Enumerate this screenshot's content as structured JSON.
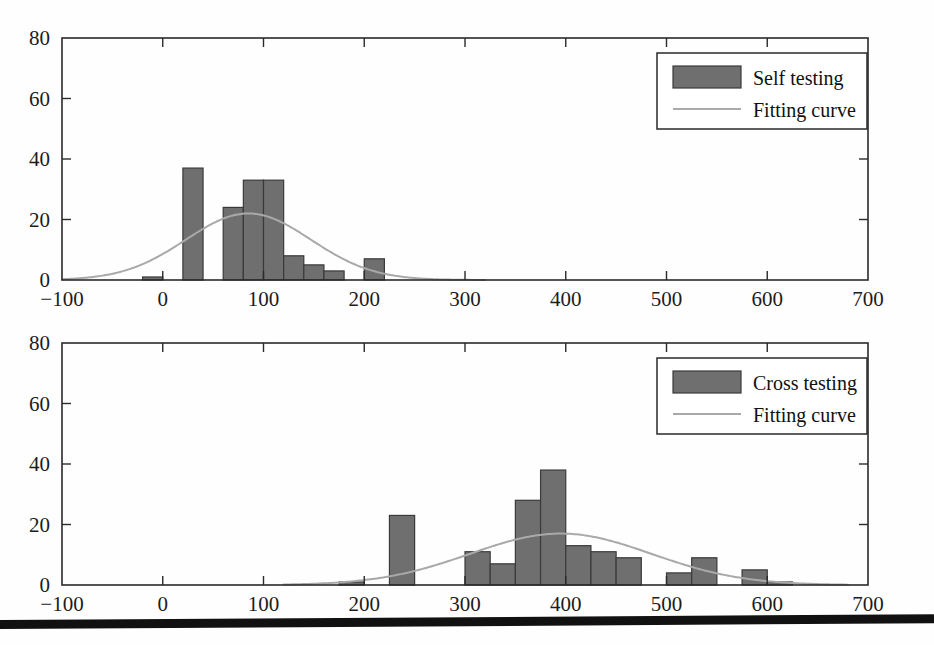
{
  "figure": {
    "background": "#ffffff",
    "bar_color": "#6f6f6f",
    "bar_edge_color": "#3a3a3a",
    "curve_color": "#a9a9a9",
    "axis_color": "#2a2a2a",
    "rule_color": "#111111"
  },
  "chart_data": [
    {
      "type": "bar",
      "id": "self-testing-histogram",
      "title": "",
      "xlabel": "",
      "ylabel": "",
      "xlim": [
        -100,
        700
      ],
      "ylim": [
        0,
        80
      ],
      "xticks": [
        -100,
        0,
        100,
        200,
        300,
        400,
        500,
        600,
        700
      ],
      "xticklabels": [
        "-100",
        "0",
        "100",
        "200",
        "300",
        "400",
        "500",
        "600",
        "700"
      ],
      "yticks": [
        0,
        20,
        40,
        60,
        80
      ],
      "yticklabels": [
        "0",
        "20",
        "40",
        "60",
        "80"
      ],
      "grid": false,
      "legend_position": "upper right",
      "legend": [
        "Self testing",
        "Fitting curve"
      ],
      "bin_width": 20,
      "bins": [
        {
          "x0": -80,
          "x1": -60,
          "value": 0
        },
        {
          "x0": -60,
          "x1": -40,
          "value": 0
        },
        {
          "x0": -40,
          "x1": -20,
          "value": 0
        },
        {
          "x0": -20,
          "x1": 0,
          "value": 1
        },
        {
          "x0": 0,
          "x1": 20,
          "value": 0
        },
        {
          "x0": 20,
          "x1": 40,
          "value": 37
        },
        {
          "x0": 40,
          "x1": 60,
          "value": 0
        },
        {
          "x0": 60,
          "x1": 80,
          "value": 24
        },
        {
          "x0": 80,
          "x1": 100,
          "value": 33
        },
        {
          "x0": 100,
          "x1": 120,
          "value": 33
        },
        {
          "x0": 120,
          "x1": 140,
          "value": 8
        },
        {
          "x0": 140,
          "x1": 160,
          "value": 5
        },
        {
          "x0": 160,
          "x1": 180,
          "value": 3
        },
        {
          "x0": 180,
          "x1": 200,
          "value": 0
        },
        {
          "x0": 200,
          "x1": 220,
          "value": 7
        },
        {
          "x0": 220,
          "x1": 240,
          "value": 0
        }
      ],
      "fit": {
        "label": "Fitting curve",
        "kind": "gaussian",
        "peak_x": 85,
        "peak_y": 22,
        "sigma": 62,
        "x_start": -100,
        "x_end": 320
      }
    },
    {
      "type": "bar",
      "id": "cross-testing-histogram",
      "title": "",
      "xlabel": "",
      "ylabel": "",
      "xlim": [
        -100,
        700
      ],
      "ylim": [
        0,
        80
      ],
      "xticks": [
        -100,
        0,
        100,
        200,
        300,
        400,
        500,
        600,
        700
      ],
      "xticklabels": [
        "-100",
        "0",
        "100",
        "200",
        "300",
        "400",
        "500",
        "600",
        "700"
      ],
      "yticks": [
        0,
        20,
        40,
        60,
        80
      ],
      "yticklabels": [
        "0",
        "20",
        "40",
        "60",
        "80"
      ],
      "grid": false,
      "legend_position": "upper right",
      "legend": [
        "Cross testing",
        "Fitting curve"
      ],
      "bin_width": 25,
      "bins": [
        {
          "x0": 175,
          "x1": 200,
          "value": 1
        },
        {
          "x0": 200,
          "x1": 225,
          "value": 0
        },
        {
          "x0": 225,
          "x1": 250,
          "value": 23
        },
        {
          "x0": 250,
          "x1": 275,
          "value": 0
        },
        {
          "x0": 275,
          "x1": 300,
          "value": 0
        },
        {
          "x0": 300,
          "x1": 325,
          "value": 11
        },
        {
          "x0": 325,
          "x1": 350,
          "value": 7
        },
        {
          "x0": 350,
          "x1": 375,
          "value": 28
        },
        {
          "x0": 375,
          "x1": 400,
          "value": 38
        },
        {
          "x0": 400,
          "x1": 425,
          "value": 13
        },
        {
          "x0": 425,
          "x1": 450,
          "value": 11
        },
        {
          "x0": 450,
          "x1": 475,
          "value": 9
        },
        {
          "x0": 475,
          "x1": 500,
          "value": 0
        },
        {
          "x0": 500,
          "x1": 525,
          "value": 4
        },
        {
          "x0": 525,
          "x1": 550,
          "value": 9
        },
        {
          "x0": 550,
          "x1": 575,
          "value": 0
        },
        {
          "x0": 575,
          "x1": 600,
          "value": 5
        },
        {
          "x0": 600,
          "x1": 625,
          "value": 1
        }
      ],
      "fit": {
        "label": "Fitting curve",
        "kind": "gaussian",
        "peak_x": 395,
        "peak_y": 17,
        "sigma": 90,
        "x_start": 120,
        "x_end": 680
      }
    }
  ],
  "panels": [
    {
      "name": "top",
      "legend": {
        "series_label": "Self testing",
        "curve_label": "Fitting curve"
      }
    },
    {
      "name": "bottom",
      "legend": {
        "series_label": "Cross testing",
        "curve_label": "Fitting curve"
      }
    }
  ]
}
